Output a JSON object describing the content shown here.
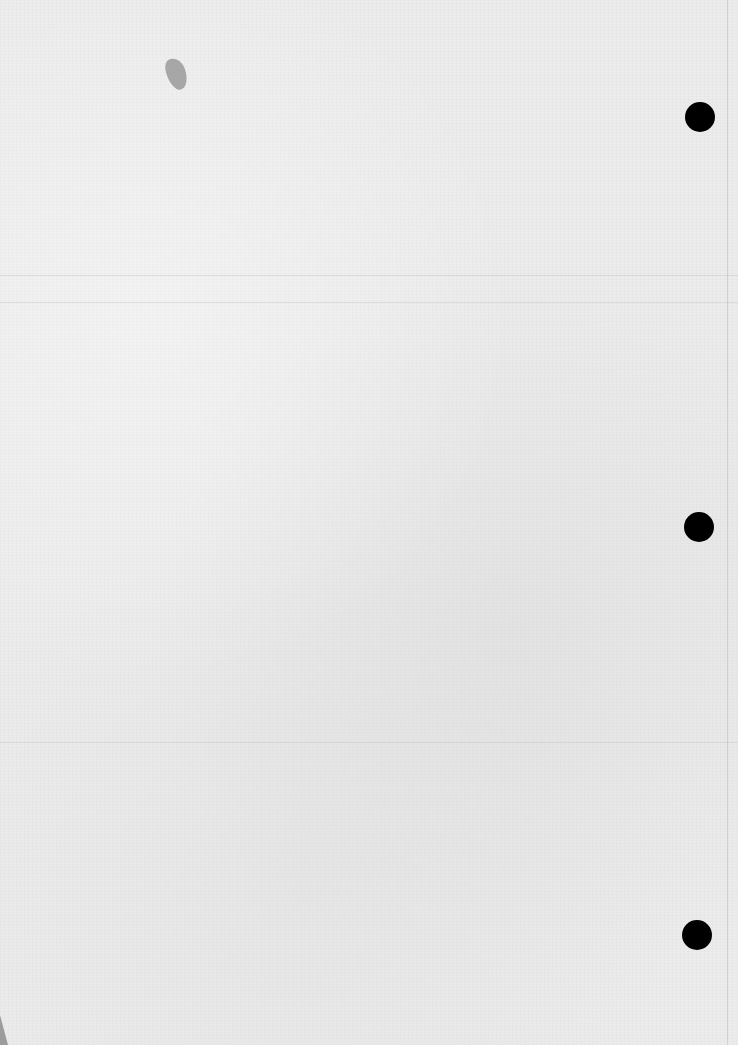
{
  "document": {
    "type": "blank scanned page",
    "text": "",
    "background_color": "#ececec"
  },
  "punch_holes": [
    {
      "cx": 700,
      "cy": 117,
      "r": 15
    },
    {
      "cx": 699,
      "cy": 527,
      "r": 15
    },
    {
      "cx": 697,
      "cy": 935,
      "r": 15
    }
  ],
  "marks": [
    {
      "type": "smudge",
      "x": 167,
      "y": 58,
      "color": "#9a9a9a"
    }
  ]
}
